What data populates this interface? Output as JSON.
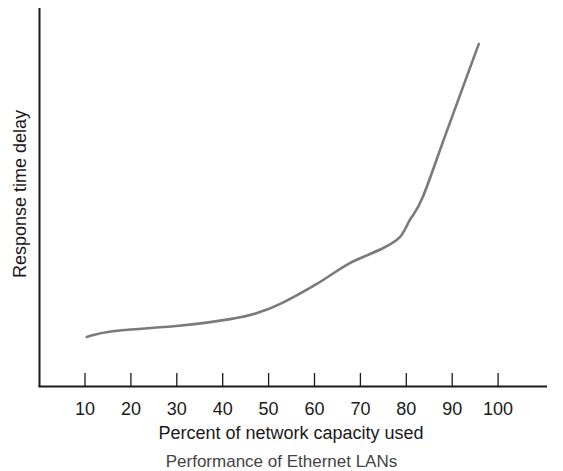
{
  "chart_data": {
    "type": "line",
    "title": "",
    "xlabel": "Percent of network capacity used",
    "ylabel": "Response time delay",
    "x_ticks": [
      10,
      20,
      30,
      40,
      50,
      60,
      70,
      80,
      90,
      100
    ],
    "x_tick_labels": [
      "10",
      "20",
      "30",
      "40",
      "50",
      "60",
      "70",
      "80",
      "90",
      "100"
    ],
    "xlim": [
      0,
      110
    ],
    "ylim": [
      0,
      100
    ],
    "y_ticks": [],
    "grid": false,
    "legend": null,
    "series": [
      {
        "name": "Response time delay",
        "color": "#7a7a7a",
        "x": [
          10.4,
          16,
          31,
          41.6,
          47.5,
          53,
          60.5,
          67.7,
          75,
          78.6,
          80.8,
          83.6,
          88.9,
          95.8
        ],
        "y": [
          13,
          14.5,
          16,
          17.7,
          19.3,
          22,
          27,
          32.5,
          36.5,
          39.4,
          44,
          50,
          67.7,
          90.5
        ]
      }
    ],
    "caption": "Performance of Ethernet LANs"
  },
  "axes": {
    "color": "#1a1a1a"
  }
}
